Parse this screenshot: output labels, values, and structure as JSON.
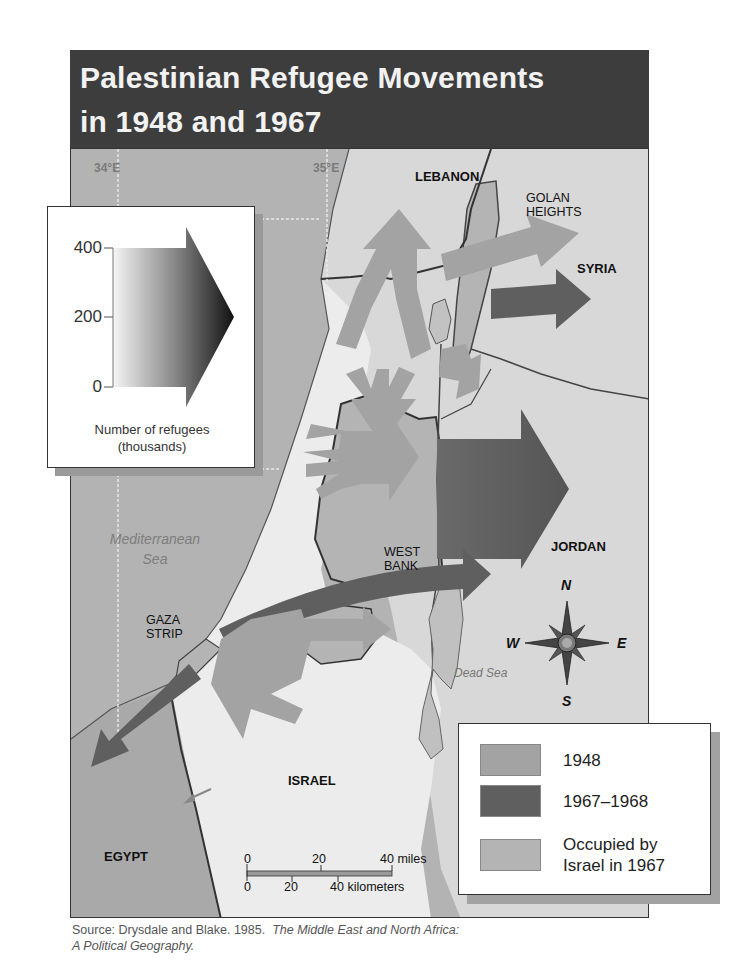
{
  "title": {
    "line1": "Palestinian Refugee Movements",
    "line2": "in 1948 and 1967"
  },
  "map": {
    "grid_labels": {
      "lon_34": "34°E",
      "lon_35": "35°E",
      "lat_32": "32°N"
    },
    "region_labels": {
      "lebanon": "LEBANON",
      "golan_heights_1": "GOLAN",
      "golan_heights_2": "HEIGHTS",
      "syria": "SYRIA",
      "jordan": "JORDAN",
      "west_bank_1": "WEST",
      "west_bank_2": "BANK",
      "gaza_strip_1": "GAZA",
      "gaza_strip_2": "STRIP",
      "israel": "ISRAEL",
      "egypt": "EGYPT"
    },
    "water_labels": {
      "mediterranean_1": "Mediterranean",
      "mediterranean_2": "Sea",
      "dead_sea": "Dead Sea"
    },
    "compass": {
      "n": "N",
      "s": "S",
      "e": "E",
      "w": "W"
    },
    "scale_bar": {
      "miles_0": "0",
      "miles_20": "20",
      "miles_40": "40 miles",
      "km_0": "0",
      "km_20": "20",
      "km_40": "40 kilometers"
    },
    "colors": {
      "sea": "#b3b3b3",
      "land_other": "#d9d9d9",
      "israel": "#ececec",
      "occupied_1967": "#b4b4b4",
      "arrow_1948": "#a3a3a3",
      "arrow_1967": "#5f5f5f",
      "title_bar": "#3d3d3d",
      "border": "#333333"
    }
  },
  "size_legend": {
    "ticks": [
      "400",
      "200",
      "0"
    ],
    "caption_1": "Number of refugees",
    "caption_2": "(thousands)"
  },
  "color_legend": {
    "items": [
      {
        "label_1": "1948",
        "label_2": "",
        "color": "#a3a3a3"
      },
      {
        "label_1": "1967–1968",
        "label_2": "",
        "color": "#5f5f5f"
      },
      {
        "label_1": "Occupied by",
        "label_2": "Israel in 1967",
        "color": "#b4b4b4"
      }
    ]
  },
  "source": {
    "prefix": "Source: Drysdale and Blake. 1985.",
    "title_line1": "The Middle East and North Africa:",
    "title_line2": "A Political Geography."
  }
}
